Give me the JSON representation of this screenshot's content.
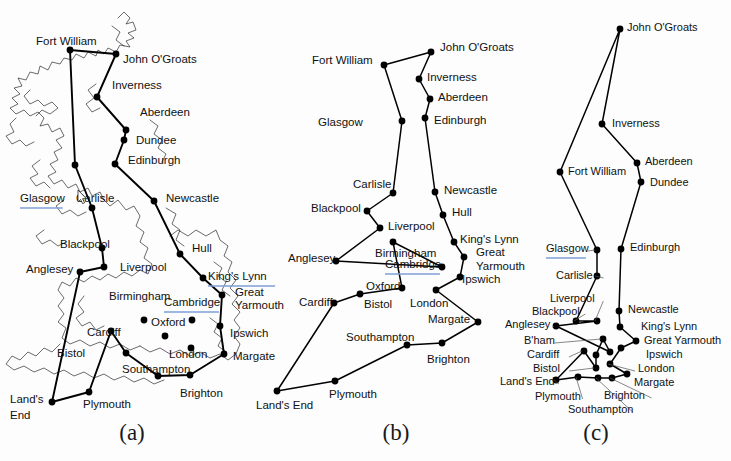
{
  "figure": {
    "background": "#fdfdfd",
    "ink": "#000000",
    "link_underline_color": "#7d9fd6",
    "captions": {
      "a": "(a)",
      "b": "(b)",
      "c": "(c)"
    }
  },
  "cities": [
    "Fort William",
    "John O'Groats",
    "Inverness",
    "Aberdeen",
    "Dundee",
    "Edinburgh",
    "Glasgow",
    "Carlisle",
    "Newcastle",
    "Blackpool",
    "Liverpool",
    "Hull",
    "Anglesey",
    "King's Lynn",
    "Birmingham",
    "Cambridge",
    "Great Yarmouth",
    "Ipswich",
    "Cardiff",
    "Oxford",
    "Bistol",
    "London",
    "Margate",
    "Southampton",
    "Brighton",
    "Land's End",
    "Plymouth",
    "B'ham",
    "Great Yarmouth"
  ],
  "panel_a": {
    "caption": "(a)",
    "linked_labels": [
      "Glasgow",
      "Cambridge",
      "King's Lynn"
    ],
    "nodes": [
      {
        "name": "John O'Groats",
        "label": "John  O'Groats",
        "x": 116,
        "y": 54,
        "lx": 123,
        "ly": 60,
        "anchor": "start"
      },
      {
        "name": "Fort William",
        "label": "Fort William",
        "x": 70,
        "y": 50,
        "lx": 36,
        "ly": 42,
        "anchor": "start"
      },
      {
        "name": "Inverness",
        "label": "Inverness",
        "x": 97,
        "y": 97,
        "lx": 112,
        "ly": 86,
        "anchor": "start"
      },
      {
        "name": "Aberdeen",
        "label": "Aberdeen",
        "x": 126,
        "y": 130,
        "lx": 140,
        "ly": 113,
        "anchor": "start"
      },
      {
        "name": "Dundee",
        "label": "Dundee",
        "x": 124,
        "y": 140,
        "lx": 136,
        "ly": 141,
        "anchor": "start"
      },
      {
        "name": "Edinburgh",
        "label": "Edinburgh",
        "x": 115,
        "y": 164,
        "lx": 128,
        "ly": 161,
        "anchor": "start"
      },
      {
        "name": "Glasgow",
        "label": "Glasgow",
        "x": 75,
        "y": 165,
        "lx": 20,
        "ly": 199,
        "anchor": "start"
      },
      {
        "name": "Carlisle",
        "label": "Carlisle",
        "x": 92,
        "y": 208,
        "lx": 76,
        "ly": 199,
        "anchor": "start"
      },
      {
        "name": "Newcastle",
        "label": "Newcastle",
        "x": 154,
        "y": 201,
        "lx": 166,
        "ly": 199,
        "anchor": "start"
      },
      {
        "name": "Blackpool",
        "label": "Blackpool",
        "x": 102,
        "y": 248,
        "lx": 60,
        "ly": 245,
        "anchor": "start"
      },
      {
        "name": "Liverpool",
        "label": "Liverpool",
        "x": 104,
        "y": 267,
        "lx": 120,
        "ly": 268,
        "anchor": "start"
      },
      {
        "name": "Hull",
        "label": "Hull",
        "x": 180,
        "y": 254,
        "lx": 192,
        "ly": 249,
        "anchor": "start"
      },
      {
        "name": "Anglesey",
        "label": "Anglesey",
        "x": 80,
        "y": 272,
        "lx": 26,
        "ly": 270,
        "anchor": "start"
      },
      {
        "name": "King's Lynn",
        "label": "King's Lynn",
        "x": 203,
        "y": 278,
        "lx": 208,
        "ly": 277,
        "anchor": "start"
      },
      {
        "name": "Birmingham",
        "label": "Birmingham",
        "x": 144,
        "y": 320,
        "lx": 109,
        "ly": 297,
        "anchor": "start"
      },
      {
        "name": "Cambridge",
        "label": "Cambridge",
        "x": 192,
        "y": 320,
        "lx": 164,
        "ly": 303,
        "anchor": "start"
      },
      {
        "name": "Great Yarmouth",
        "label": "Great",
        "x": 222,
        "y": 295,
        "lx": 235,
        "ly": 293,
        "anchor": "start"
      },
      {
        "name": "Yarmouth2",
        "label": "Yarmouth",
        "x": -1,
        "y": -1,
        "lx": 235,
        "ly": 306,
        "anchor": "start"
      },
      {
        "name": "Ipswich",
        "label": "Ipswich",
        "x": 220,
        "y": 326,
        "lx": 230,
        "ly": 334,
        "anchor": "start"
      },
      {
        "name": "Cardiff",
        "label": "Cardiff",
        "x": 111,
        "y": 331,
        "lx": 87,
        "ly": 333,
        "anchor": "start"
      },
      {
        "name": "Oxford",
        "label": "Oxford",
        "x": 165,
        "y": 336,
        "lx": 151,
        "ly": 323,
        "anchor": "start"
      },
      {
        "name": "Bistol",
        "label": "Bistol",
        "x": 126,
        "y": 353,
        "lx": 57,
        "ly": 354,
        "anchor": "start"
      },
      {
        "name": "London",
        "label": "London",
        "x": 191,
        "y": 348,
        "lx": 169,
        "ly": 355,
        "anchor": "start"
      },
      {
        "name": "Margate",
        "label": "Margate",
        "x": 224,
        "y": 354,
        "lx": 233,
        "ly": 357,
        "anchor": "start"
      },
      {
        "name": "Southampton",
        "label": "Southampton",
        "x": 158,
        "y": 376,
        "lx": 122,
        "ly": 370,
        "anchor": "start"
      },
      {
        "name": "Brighton",
        "label": "Brighton",
        "x": 190,
        "y": 375,
        "lx": 180,
        "ly": 394,
        "anchor": "start"
      },
      {
        "name": "Plymouth",
        "label": "Plymouth",
        "x": 89,
        "y": 392,
        "lx": 83,
        "ly": 405,
        "anchor": "start"
      },
      {
        "name": "Land's End",
        "label": "Land's",
        "x": 52,
        "y": 402,
        "lx": 10,
        "ly": 400,
        "anchor": "start"
      },
      {
        "name": "End2",
        "label": "End",
        "x": -1,
        "y": -1,
        "lx": 10,
        "ly": 416,
        "anchor": "start"
      }
    ],
    "tour": [
      [
        116,
        54
      ],
      [
        97,
        97
      ],
      [
        126,
        130
      ],
      [
        124,
        140
      ],
      [
        115,
        164
      ],
      [
        154,
        201
      ],
      [
        180,
        254
      ],
      [
        203,
        278
      ],
      [
        222,
        295
      ],
      [
        220,
        326
      ],
      [
        224,
        354
      ],
      [
        190,
        375
      ],
      [
        158,
        376
      ],
      [
        126,
        353
      ],
      [
        111,
        331
      ],
      [
        89,
        392
      ],
      [
        52,
        402
      ],
      [
        80,
        272
      ],
      [
        104,
        267
      ],
      [
        102,
        248
      ],
      [
        92,
        208
      ],
      [
        75,
        165
      ],
      [
        70,
        50
      ],
      [
        116,
        54
      ]
    ]
  },
  "panel_b": {
    "caption": "(b)",
    "linked_labels": [
      "Cambridge"
    ],
    "nodes": [
      {
        "name": "John O'Groats",
        "label": "John  O'Groats",
        "x": 431,
        "y": 52,
        "lx": 440,
        "ly": 48,
        "anchor": "start"
      },
      {
        "name": "Fort William",
        "label": "Fort William",
        "x": 384,
        "y": 65,
        "lx": 312,
        "ly": 61,
        "anchor": "start"
      },
      {
        "name": "Inverness",
        "label": "Inverness",
        "x": 419,
        "y": 79,
        "lx": 427,
        "ly": 78,
        "anchor": "start"
      },
      {
        "name": "Aberdeen",
        "label": "Aberdeen",
        "x": 430,
        "y": 99,
        "lx": 438,
        "ly": 98,
        "anchor": "start"
      },
      {
        "name": "Edinburgh",
        "label": "Edinburgh",
        "x": 425,
        "y": 118,
        "lx": 434,
        "ly": 121,
        "anchor": "start"
      },
      {
        "name": "Glasgow",
        "label": "Glasgow",
        "x": 402,
        "y": 121,
        "lx": 318,
        "ly": 123,
        "anchor": "start"
      },
      {
        "name": "Carlisle",
        "label": "Carlisle",
        "x": 393,
        "y": 193,
        "lx": 353,
        "ly": 185,
        "anchor": "start"
      },
      {
        "name": "Newcastle",
        "label": "Newcastle",
        "x": 435,
        "y": 192,
        "lx": 444,
        "ly": 191,
        "anchor": "start"
      },
      {
        "name": "Blackpool",
        "label": "Blackpool",
        "x": 367,
        "y": 211,
        "lx": 311,
        "ly": 209,
        "anchor": "start"
      },
      {
        "name": "Hull",
        "label": "Hull",
        "x": 443,
        "y": 215,
        "lx": 452,
        "ly": 213,
        "anchor": "start"
      },
      {
        "name": "Liverpool",
        "label": "Liverpool",
        "x": 380,
        "y": 228,
        "lx": 388,
        "ly": 227,
        "anchor": "start"
      },
      {
        "name": "King's Lynn",
        "label": "King's Lynn",
        "x": 454,
        "y": 242,
        "lx": 460,
        "ly": 240,
        "anchor": "start"
      },
      {
        "name": "Birmingham",
        "label": "Birmingham",
        "x": 393,
        "y": 242,
        "lx": 375,
        "ly": 254,
        "anchor": "start"
      },
      {
        "name": "Anglesey",
        "label": "Anglesey",
        "x": 336,
        "y": 261,
        "lx": 288,
        "ly": 259,
        "anchor": "start"
      },
      {
        "name": "Great Yarmouth",
        "label": "Great",
        "x": 464,
        "y": 257,
        "lx": 476,
        "ly": 253,
        "anchor": "start"
      },
      {
        "name": "Yarmouth2",
        "label": "Yarmouth",
        "x": -1,
        "y": -1,
        "lx": 476,
        "ly": 267,
        "anchor": "start"
      },
      {
        "name": "Cambridge",
        "label": "Cambridge",
        "x": 442,
        "y": 267,
        "lx": 385,
        "ly": 265,
        "anchor": "start"
      },
      {
        "name": "Ipswich",
        "label": "Ipswich",
        "x": 460,
        "y": 277,
        "lx": 462,
        "ly": 280,
        "anchor": "start"
      },
      {
        "name": "Oxford",
        "label": "Oxford",
        "x": 402,
        "y": 288,
        "lx": 366,
        "ly": 287,
        "anchor": "start"
      },
      {
        "name": "Cardiff",
        "label": "Cardiff",
        "x": 334,
        "y": 303,
        "lx": 299,
        "ly": 303,
        "anchor": "start"
      },
      {
        "name": "Bistol",
        "label": "Bistol",
        "x": 360,
        "y": 294,
        "lx": 364,
        "ly": 305,
        "anchor": "start"
      },
      {
        "name": "London",
        "label": "London",
        "x": 436,
        "y": 290,
        "lx": 410,
        "ly": 304,
        "anchor": "start"
      },
      {
        "name": "Margate",
        "label": "Margate",
        "x": 478,
        "y": 322,
        "lx": 428,
        "ly": 320,
        "anchor": "start"
      },
      {
        "name": "Southampton",
        "label": "Southampton",
        "x": 407,
        "y": 345,
        "lx": 346,
        "ly": 338,
        "anchor": "start"
      },
      {
        "name": "Brighton",
        "label": "Brighton",
        "x": 442,
        "y": 343,
        "lx": 427,
        "ly": 360,
        "anchor": "start"
      },
      {
        "name": "Plymouth",
        "label": "Plymouth",
        "x": 335,
        "y": 381,
        "lx": 329,
        "ly": 395,
        "anchor": "start"
      },
      {
        "name": "Land's End",
        "label": "Land's End",
        "x": 277,
        "y": 391,
        "lx": 256,
        "ly": 406,
        "anchor": "start"
      }
    ],
    "tour": [
      [
        431,
        52
      ],
      [
        419,
        79
      ],
      [
        430,
        99
      ],
      [
        425,
        118
      ],
      [
        435,
        192
      ],
      [
        443,
        215
      ],
      [
        454,
        242
      ],
      [
        464,
        257
      ],
      [
        460,
        277
      ],
      [
        436,
        290
      ],
      [
        478,
        322
      ],
      [
        442,
        343
      ],
      [
        407,
        345
      ],
      [
        335,
        381
      ],
      [
        277,
        391
      ],
      [
        334,
        303
      ],
      [
        360,
        294
      ],
      [
        402,
        288
      ],
      [
        393,
        242
      ],
      [
        442,
        267
      ],
      [
        336,
        261
      ],
      [
        380,
        228
      ],
      [
        367,
        211
      ],
      [
        393,
        193
      ],
      [
        402,
        121
      ],
      [
        384,
        65
      ],
      [
        431,
        52
      ]
    ]
  },
  "panel_c": {
    "caption": "(c)",
    "linked_labels": [
      "Glasgow"
    ],
    "nodes": [
      {
        "name": "John O'Groats",
        "label": "John  O'Groats",
        "x": 620,
        "y": 29,
        "lx": 627,
        "ly": 28,
        "anchor": "start"
      },
      {
        "name": "Inverness",
        "label": "Inverness",
        "x": 602,
        "y": 124,
        "lx": 612,
        "ly": 124,
        "anchor": "start"
      },
      {
        "name": "Fort William",
        "label": "Fort William",
        "x": 560,
        "y": 172,
        "lx": 568,
        "ly": 172,
        "anchor": "start"
      },
      {
        "name": "Aberdeen",
        "label": "Aberdeen",
        "x": 637,
        "y": 163,
        "lx": 645,
        "ly": 162,
        "anchor": "start"
      },
      {
        "name": "Dundee",
        "label": "Dundee",
        "x": 641,
        "y": 182,
        "lx": 650,
        "ly": 183,
        "anchor": "start"
      },
      {
        "name": "Glasgow",
        "label": "Glasgow",
        "x": 597,
        "y": 250,
        "lx": 546,
        "ly": 249,
        "anchor": "start"
      },
      {
        "name": "Edinburgh",
        "label": "Edinburgh",
        "x": 621,
        "y": 249,
        "lx": 630,
        "ly": 248,
        "anchor": "start"
      },
      {
        "name": "Carlisle",
        "label": "Carlisle",
        "x": 597,
        "y": 276,
        "lx": 556,
        "ly": 276,
        "anchor": "start"
      },
      {
        "name": "Liverpool",
        "label": "Liverpool",
        "x": 597,
        "y": 321,
        "lx": 550,
        "ly": 299,
        "anchor": "start"
      },
      {
        "name": "Newcastle",
        "label": "Newcastle",
        "x": 619,
        "y": 311,
        "lx": 628,
        "ly": 310,
        "anchor": "start"
      },
      {
        "name": "Blackpool",
        "label": "Blackpool",
        "x": 576,
        "y": 321,
        "lx": 532,
        "ly": 312,
        "anchor": "start"
      },
      {
        "name": "Anglesey",
        "label": "Anglesey",
        "x": 556,
        "y": 326,
        "lx": 505,
        "ly": 325,
        "anchor": "start"
      },
      {
        "name": "King's Lynn",
        "label": "King's Lynn",
        "x": 620,
        "y": 327,
        "lx": 641,
        "ly": 327,
        "anchor": "start"
      },
      {
        "name": "B'ham",
        "label": "B'ham",
        "x": 603,
        "y": 339,
        "lx": 524,
        "ly": 341,
        "anchor": "start"
      },
      {
        "name": "Great Yarmouth",
        "label": "Great Yarmouth",
        "x": 636,
        "y": 341,
        "lx": 644,
        "ly": 341,
        "anchor": "start"
      },
      {
        "name": "Cardiff",
        "label": "Cardiff",
        "x": 584,
        "y": 351,
        "lx": 527,
        "ly": 355,
        "anchor": "start"
      },
      {
        "name": "Ipswich",
        "label": "Ipswich",
        "x": 621,
        "y": 348,
        "lx": 646,
        "ly": 355,
        "anchor": "start"
      },
      {
        "name": "Cambridge",
        "label": "",
        "x": 596,
        "y": 355,
        "lx": -1,
        "ly": -1,
        "anchor": "start"
      },
      {
        "name": "Hull",
        "label": "",
        "x": 610,
        "y": 352,
        "lx": -1,
        "ly": -1,
        "anchor": "start"
      },
      {
        "name": "Bistol",
        "label": "Bistol",
        "x": 596,
        "y": 368,
        "lx": 533,
        "ly": 369,
        "anchor": "start"
      },
      {
        "name": "London",
        "label": "London",
        "x": 610,
        "y": 364,
        "lx": 638,
        "ly": 369,
        "anchor": "start"
      },
      {
        "name": "Margate",
        "label": "Margate",
        "x": 627,
        "y": 374,
        "lx": 634,
        "ly": 383,
        "anchor": "start"
      },
      {
        "name": "Brighton",
        "label": "Brighton",
        "x": 612,
        "y": 378,
        "lx": 604,
        "ly": 396,
        "anchor": "start"
      },
      {
        "name": "Southampton",
        "label": "Southampton",
        "x": 598,
        "y": 378,
        "lx": 568,
        "ly": 410,
        "anchor": "start"
      },
      {
        "name": "Plymouth",
        "label": "Plymouth",
        "x": 578,
        "y": 377,
        "lx": 535,
        "ly": 397,
        "anchor": "start"
      },
      {
        "name": "Land's End",
        "label": "Land's End",
        "x": 556,
        "y": 380,
        "lx": 500,
        "ly": 382,
        "anchor": "start"
      }
    ],
    "tour": [
      [
        620,
        29
      ],
      [
        602,
        124
      ],
      [
        637,
        163
      ],
      [
        641,
        182
      ],
      [
        621,
        249
      ],
      [
        619,
        311
      ],
      [
        620,
        327
      ],
      [
        636,
        341
      ],
      [
        621,
        348
      ],
      [
        610,
        364
      ],
      [
        627,
        374
      ],
      [
        612,
        378
      ],
      [
        598,
        378
      ],
      [
        578,
        377
      ],
      [
        556,
        380
      ],
      [
        584,
        351
      ],
      [
        596,
        368
      ],
      [
        596,
        355
      ],
      [
        603,
        339
      ],
      [
        610,
        352
      ],
      [
        556,
        326
      ],
      [
        597,
        321
      ],
      [
        576,
        321
      ],
      [
        597,
        276
      ],
      [
        597,
        250
      ],
      [
        560,
        172
      ],
      [
        620,
        29
      ]
    ]
  }
}
